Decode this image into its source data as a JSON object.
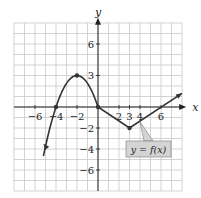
{
  "chart_data": {
    "type": "line",
    "title": "",
    "xlabel": "x",
    "ylabel": "y",
    "xlim": [
      -8,
      8
    ],
    "ylim": [
      -8,
      8
    ],
    "grid": true,
    "x_tick_labels": [
      "-6",
      "-4",
      "-2",
      "2",
      "3",
      "4",
      "6"
    ],
    "y_tick_labels": [
      "6",
      "3",
      "-2",
      "-4",
      "-6"
    ],
    "series": [
      {
        "name": "y = f(x)",
        "points": [
          [
            -5.2,
            -3.5
          ],
          [
            -4,
            0
          ],
          [
            -2,
            3
          ],
          [
            0,
            0
          ],
          [
            3,
            -2
          ],
          [
            8,
            1.3
          ]
        ],
        "marked_points": [
          [
            -4,
            0
          ],
          [
            -2,
            3
          ],
          [
            0,
            0
          ],
          [
            3,
            -2
          ]
        ],
        "arrows": [
          "left-end",
          "right-end"
        ]
      }
    ],
    "annotations": [
      {
        "text": "y = f(x)",
        "box": true,
        "points_to": [
          4,
          -1.3
        ]
      }
    ]
  },
  "axes": {
    "x_label": "x",
    "y_label": "y"
  },
  "ticks": {
    "x": [
      {
        "value": -6,
        "label": "−6"
      },
      {
        "value": -4,
        "label": "−4"
      },
      {
        "value": -2,
        "label": "−2"
      },
      {
        "value": 2,
        "label": "2"
      },
      {
        "value": 3,
        "label": "3"
      },
      {
        "value": 4,
        "label": "4"
      },
      {
        "value": 6,
        "label": "6"
      }
    ],
    "y": [
      {
        "value": 6,
        "label": "6"
      },
      {
        "value": 3,
        "label": "3"
      },
      {
        "value": -2,
        "label": "−2"
      },
      {
        "value": -4,
        "label": "−4"
      },
      {
        "value": -6,
        "label": "−6"
      }
    ]
  },
  "callout": {
    "label": "y = f(x)"
  },
  "colors": {
    "curve": "#333333",
    "grid": "#c8c8c8",
    "callout_bg": "#d4d4d4",
    "axis": "#222222"
  }
}
